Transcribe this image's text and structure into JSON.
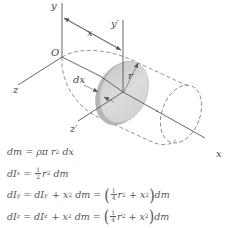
{
  "figure": {
    "labels": {
      "y_axis": "y",
      "y_prime_axis": "y′",
      "origin": "O",
      "x_dimension": "x",
      "z_axis": "z",
      "z_prime_axis": "z′",
      "x_axis": "x",
      "dx": "dx",
      "radius": "r"
    },
    "colors": {
      "lines": "#555555",
      "disk_fill": "#d4d4d4",
      "disk_edge": "#b5b5b5",
      "text": "#444444"
    }
  },
  "equations": [
    {
      "id": "dm",
      "lhs": "dm",
      "rhs": "ρπ r² dx"
    },
    {
      "id": "dIx",
      "lhs": "dIₓ",
      "rhs": "½ r² dm"
    },
    {
      "id": "dIy",
      "lhs": "dI_y",
      "middle": "dI_y′ + x² dm",
      "rhs": "(¼ r² + x²)dm"
    },
    {
      "id": "dIz",
      "lhs": "dI_z",
      "middle": "dI_z′ + x² dm",
      "rhs": "(¼ r² + x²)dm"
    }
  ],
  "equation_parts": {
    "eq1": {
      "d": "d",
      "m": "m",
      "eq": "=",
      "rho_pi": "ρπ",
      "r": "r",
      "two": "2",
      "dx": "dx"
    },
    "eq2": {
      "dI": "dI",
      "sub": "x",
      "eq": "=",
      "num": "1",
      "den": "2",
      "r": "r",
      "two": "2",
      "dm": "dm"
    },
    "eq3": {
      "dI": "dI",
      "sub": "y",
      "eq": "=",
      "dI2": "dI",
      "sub2": "y′",
      "plus": "+",
      "x": "x",
      "two": "2",
      "dm": "dm",
      "eq2": "=",
      "lp": "(",
      "num": "1",
      "den": "4",
      "r": "r",
      "two_b": "2",
      "plus2": "+",
      "x2": "x",
      "two_c": "2",
      "rp": ")",
      "dm2": "dm"
    },
    "eq4": {
      "dI": "dI",
      "sub": "z",
      "eq": "=",
      "dI2": "dI",
      "sub2": "z′",
      "plus": "+",
      "x": "x",
      "two": "2",
      "dm": "dm",
      "eq2": "=",
      "lp": "(",
      "num": "1",
      "den": "4",
      "r": "r",
      "two_b": "2",
      "plus2": "+",
      "x2": "x",
      "two_c": "2",
      "rp": ")",
      "dm2": "dm"
    }
  }
}
